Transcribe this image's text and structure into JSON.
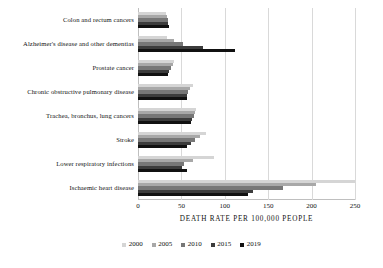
{
  "chart_data": {
    "type": "bar",
    "orientation": "horizontal",
    "title": "",
    "xlabel": "DEATH RATE PER 100,000 PEOPLE",
    "ylabel": "",
    "xlim": [
      0,
      250
    ],
    "xticks": [
      0,
      50,
      100,
      150,
      200,
      250
    ],
    "grid": true,
    "legend_position": "bottom",
    "categories": [
      "Colon and rectum cancers",
      "Alzheimer's disease and other dementias",
      "Prostate cancer",
      "Chronic obstructive pulmonary disease",
      "Trachea, bronchus, lung cancers",
      "Stroke",
      "Lower respiratory infections",
      "Ischaemic heart disease"
    ],
    "series": [
      {
        "name": "2000",
        "color": "#d5d5d5",
        "values": [
          32,
          33,
          42,
          63,
          67,
          78,
          88,
          250
        ]
      },
      {
        "name": "2005",
        "color": "#a8a8a8",
        "values": [
          33,
          42,
          40,
          60,
          66,
          72,
          63,
          205
        ]
      },
      {
        "name": "2010",
        "color": "#777777",
        "values": [
          34,
          52,
          38,
          58,
          64,
          66,
          53,
          167
        ]
      },
      {
        "name": "2015",
        "color": "#3c3c3c",
        "values": [
          35,
          75,
          36,
          57,
          62,
          61,
          51,
          133
        ]
      },
      {
        "name": "2019",
        "color": "#111111",
        "values": [
          36,
          112,
          35,
          56,
          61,
          57,
          56,
          127
        ]
      }
    ]
  },
  "legend": {
    "items": [
      {
        "label": "2000",
        "color": "#d5d5d5"
      },
      {
        "label": "2005",
        "color": "#a8a8a8"
      },
      {
        "label": "2010",
        "color": "#777777"
      },
      {
        "label": "2015",
        "color": "#3c3c3c"
      },
      {
        "label": "2019",
        "color": "#111111"
      }
    ]
  },
  "axis": {
    "x_title": "DEATH RATE PER 100,000 PEOPLE",
    "x_tick_labels": [
      "0",
      "50",
      "100",
      "150",
      "200",
      "250"
    ]
  }
}
